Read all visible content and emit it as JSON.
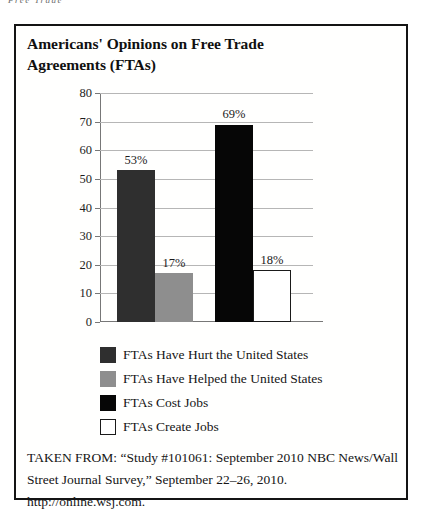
{
  "page": {
    "running_header": "Free Trade"
  },
  "figure": {
    "title_line1": "Americans' Opinions on Free Trade",
    "title_line2": "Agreements (FTAs)",
    "source_line1": "TAKEN FROM: “Study #101061: September 2010 NBC News/Wall",
    "source_line2": "Street Journal Survey,” September 22–26, 2010. http://online.wsj.com."
  },
  "colors": {
    "border": "#141414",
    "grid": "#b6b6b6",
    "axis": "#777777",
    "bar_outline": "#1a1a1a"
  },
  "chart_data": {
    "type": "bar",
    "title": "Americans' Opinions on Free Trade Agreements (FTAs)",
    "ylabel": "",
    "xlabel": "",
    "ylim": [
      0,
      80
    ],
    "yticks": [
      0,
      10,
      20,
      30,
      40,
      50,
      60,
      70,
      80
    ],
    "grid": true,
    "legend_position": "bottom",
    "series": [
      {
        "name": "FTAs Have Hurt the United States",
        "value": 53,
        "label": "53%",
        "color": "#2f2f2f",
        "outlined": false,
        "group": 0
      },
      {
        "name": "FTAs Have Helped the United States",
        "value": 17,
        "label": "17%",
        "color": "#8e8e8e",
        "outlined": false,
        "group": 0
      },
      {
        "name": "FTAs Cost Jobs",
        "value": 69,
        "label": "69%",
        "color": "#060606",
        "outlined": false,
        "group": 1
      },
      {
        "name": "FTAs Create Jobs",
        "value": 18,
        "label": "18%",
        "color": "#ffffff",
        "outlined": true,
        "group": 1
      }
    ]
  }
}
